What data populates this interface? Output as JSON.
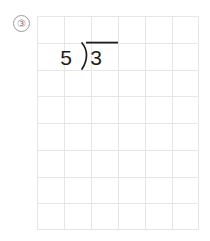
{
  "page": {
    "width": 210,
    "height": 241,
    "background_color": "#ffffff",
    "kind": "worksheet-long-division-problem"
  },
  "problem": {
    "number_label": "③",
    "number": 3,
    "marker_color": "#7c7c7c"
  },
  "grid": {
    "columns": 6,
    "rows": 8,
    "cell_width": 27,
    "cell_height": 26.75,
    "left": 37,
    "top": 16,
    "width": 162,
    "height": 214,
    "line_color": "#e6e6e6",
    "border_color": "#e2e2e2",
    "line_width": 1
  },
  "expression": {
    "type": "long-division",
    "divisor": "5",
    "dividend": "3",
    "quotient": "",
    "bracket_glyph": ")",
    "vinculum": true,
    "ink_color": "#1c1c1c",
    "latex": "5 \\overline{)3}"
  }
}
